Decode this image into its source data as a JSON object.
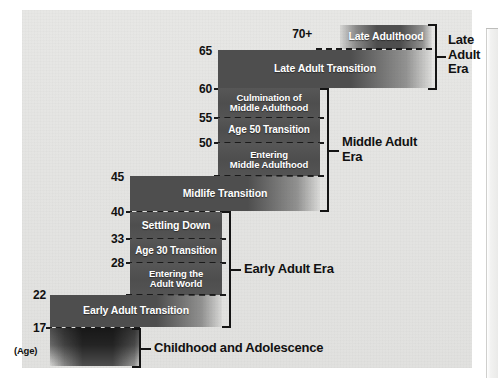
{
  "diagram": {
    "age_axis_note": "(Age)",
    "age_ticks": [
      {
        "id": "tick-70plus",
        "label": "70+"
      },
      {
        "id": "tick-65",
        "label": "65"
      },
      {
        "id": "tick-60",
        "label": "60"
      },
      {
        "id": "tick-55",
        "label": "55"
      },
      {
        "id": "tick-50",
        "label": "50"
      },
      {
        "id": "tick-45",
        "label": "45"
      },
      {
        "id": "tick-40",
        "label": "40"
      },
      {
        "id": "tick-33",
        "label": "33"
      },
      {
        "id": "tick-28",
        "label": "28"
      },
      {
        "id": "tick-22",
        "label": "22"
      },
      {
        "id": "tick-17",
        "label": "17"
      }
    ],
    "stages": [
      {
        "id": "late-adulthood",
        "label": "Late Adulthood",
        "age_start": 70,
        "age_end": 75
      },
      {
        "id": "late-adult-transition",
        "label": "Late Adult Transition",
        "age_start": 60,
        "age_end": 65
      },
      {
        "id": "culmination-of-middle-adulthood",
        "label": "Culmination of\nMiddle Adulthood",
        "age_start": 55,
        "age_end": 60
      },
      {
        "id": "age-50-transition",
        "label": "Age 50 Transition",
        "age_start": 50,
        "age_end": 55
      },
      {
        "id": "entering-middle-adulthood",
        "label": "Entering\nMiddle Adulthood",
        "age_start": 45,
        "age_end": 50
      },
      {
        "id": "midlife-transition",
        "label": "Midlife Transition",
        "age_start": 40,
        "age_end": 45
      },
      {
        "id": "settling-down",
        "label": "Settling Down",
        "age_start": 33,
        "age_end": 40
      },
      {
        "id": "age-30-transition",
        "label": "Age 30 Transition",
        "age_start": 28,
        "age_end": 33
      },
      {
        "id": "entering-the-adult-world",
        "label": "Entering the\nAdult World",
        "age_start": 22,
        "age_end": 28
      },
      {
        "id": "early-adult-transition",
        "label": "Early Adult Transition",
        "age_start": 17,
        "age_end": 22
      },
      {
        "id": "childhood-and-adolescence-bar",
        "label": "",
        "age_start": 0,
        "age_end": 17
      }
    ],
    "stage_labels": {
      "late_adulthood": "Late Adulthood",
      "late_adult_transition": "Late Adult Transition",
      "culmination_line1": "Culmination of",
      "culmination_line2": "Middle Adulthood",
      "age_50_transition": "Age 50 Transition",
      "entering_middle_line1": "Entering",
      "entering_middle_line2": "Middle Adulthood",
      "midlife_transition": "Midlife Transition",
      "settling_down": "Settling Down",
      "age_30_transition": "Age 30 Transition",
      "entering_adult_line1": "Entering the",
      "entering_adult_line2": "Adult World",
      "early_adult_transition": "Early Adult Transition"
    },
    "eras": [
      {
        "id": "late-adult-era",
        "line1": "Late",
        "line2": "Adult",
        "line3": "Era",
        "covers": "60-75"
      },
      {
        "id": "middle-adult-era",
        "line1": "Middle Adult",
        "line2": "Era",
        "line3": "",
        "covers": "40-60"
      },
      {
        "id": "early-adult-era",
        "line1": "Early Adult Era",
        "line2": "",
        "line3": "",
        "covers": "17-45"
      },
      {
        "id": "childhood-and-adolescence",
        "line1": "Childhood and Adolescence",
        "line2": "",
        "line3": "",
        "covers": "0-17"
      }
    ],
    "colors": {
      "bar_fill": "#4e4e4e",
      "plate_background": "#e4e4e2",
      "bar_text": "#ffffff",
      "axis_text": "#111111",
      "rule": "#141414"
    }
  }
}
